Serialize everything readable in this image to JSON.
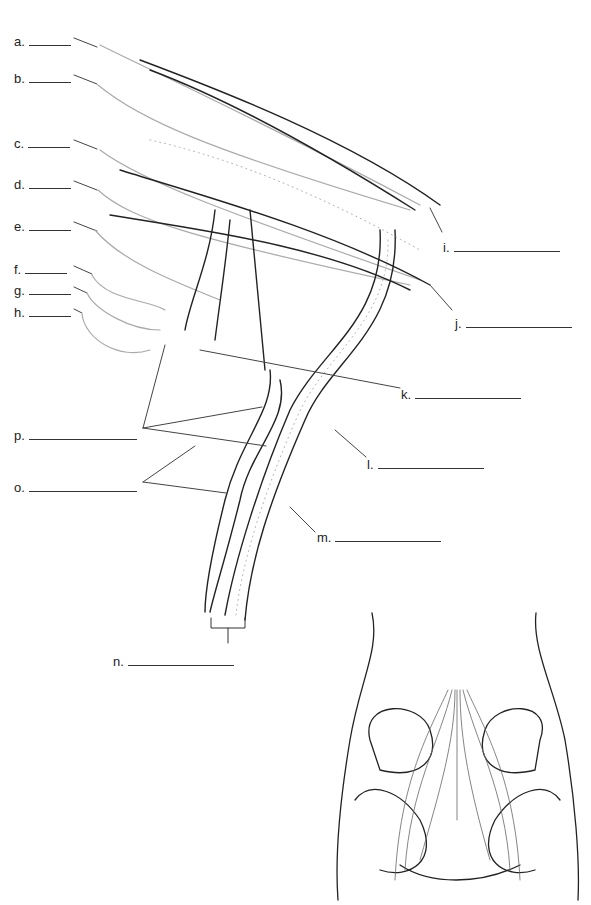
{
  "diagram": {
    "labels": [
      {
        "id": "a",
        "text": "a.",
        "x": 14,
        "y": 34,
        "blank": 42
      },
      {
        "id": "b",
        "text": "b.",
        "x": 14,
        "y": 71,
        "blank": 42
      },
      {
        "id": "c",
        "text": "c.",
        "x": 14,
        "y": 136,
        "blank": 42
      },
      {
        "id": "d",
        "text": "d.",
        "x": 14,
        "y": 177,
        "blank": 42
      },
      {
        "id": "e",
        "text": "e.",
        "x": 14,
        "y": 219,
        "blank": 42
      },
      {
        "id": "f",
        "text": "f.",
        "x": 14,
        "y": 262,
        "blank": 42
      },
      {
        "id": "g",
        "text": "g.",
        "x": 14,
        "y": 283,
        "blank": 42
      },
      {
        "id": "h",
        "text": "h.",
        "x": 14,
        "y": 305,
        "blank": 42
      },
      {
        "id": "i",
        "text": "i.",
        "x": 443,
        "y": 240,
        "blank": 106
      },
      {
        "id": "j",
        "text": "j.",
        "x": 455,
        "y": 316,
        "blank": 106
      },
      {
        "id": "k",
        "text": "k.",
        "x": 401,
        "y": 387,
        "blank": 106
      },
      {
        "id": "l",
        "text": "l.",
        "x": 367,
        "y": 457,
        "blank": 106
      },
      {
        "id": "m",
        "text": "m.",
        "x": 317,
        "y": 530,
        "blank": 106
      },
      {
        "id": "n",
        "text": "n.",
        "x": 113,
        "y": 654,
        "blank": 106
      },
      {
        "id": "o",
        "text": "o.",
        "x": 14,
        "y": 480,
        "blank": 108
      },
      {
        "id": "p",
        "text": "p.",
        "x": 14,
        "y": 428,
        "blank": 108
      }
    ],
    "inset": {
      "description": "posterior pelvis with sacral plexus overview"
    }
  }
}
